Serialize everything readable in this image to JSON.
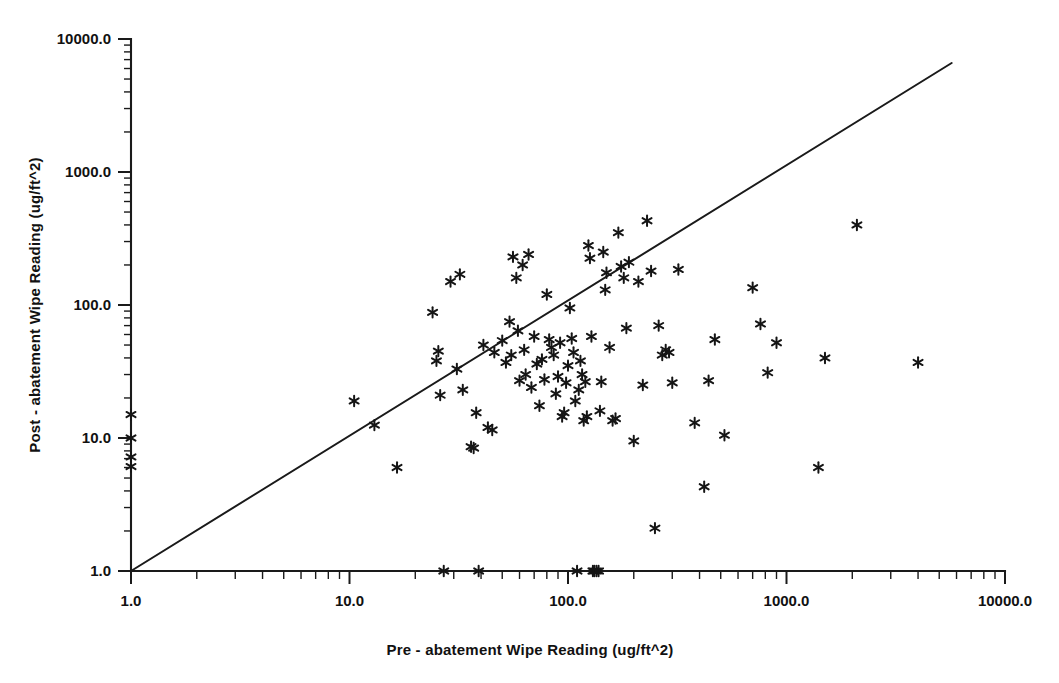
{
  "chart_data": {
    "type": "scatter",
    "title": "",
    "xlabel": "Pre - abatement Wipe Reading (ug/ft^2)",
    "ylabel": "Post - abatement Wipe Reading (ug/ft^2)",
    "xscale": "log",
    "yscale": "log",
    "xlim": [
      1.0,
      10000.0
    ],
    "ylim": [
      1.0,
      10000.0
    ],
    "grid": false,
    "legend": null,
    "xticklabels": [
      "1.0",
      "10.0",
      "100.0",
      "1000.0",
      "10000.0"
    ],
    "yticklabels": [
      "1.0",
      "10.0",
      "100.0",
      "1000.0",
      "10000.0"
    ],
    "xtickvalues": [
      1.0,
      10.0,
      100.0,
      1000.0,
      10000.0
    ],
    "ytickvalues": [
      1.0,
      10.0,
      100.0,
      1000.0,
      10000.0
    ],
    "marker": "asterisk",
    "marker_color": "#151515",
    "reference_line": {
      "label": "y = x identity line",
      "x": [
        1.0,
        5700.0
      ],
      "y": [
        1.0,
        6600.0
      ],
      "color": "#1a1a1a"
    },
    "n_points": 108,
    "points": [
      [
        1.0,
        15.0
      ],
      [
        1.0,
        10.0
      ],
      [
        1.0,
        7.2
      ],
      [
        1.0,
        6.1
      ],
      [
        10.5,
        19.0
      ],
      [
        13.0,
        12.5
      ],
      [
        16.5,
        6.0
      ],
      [
        24.0,
        88.0
      ],
      [
        25.0,
        38.0
      ],
      [
        25.5,
        45.0
      ],
      [
        26.0,
        21.0
      ],
      [
        27.0,
        1.0
      ],
      [
        29.0,
        150.0
      ],
      [
        31.0,
        33.0
      ],
      [
        32.0,
        170.0
      ],
      [
        33.0,
        23.0
      ],
      [
        36.0,
        8.6
      ],
      [
        37.0,
        8.4
      ],
      [
        38.0,
        15.5
      ],
      [
        39.0,
        1.0
      ],
      [
        41.0,
        50.0
      ],
      [
        43.0,
        12.0
      ],
      [
        45.0,
        11.5
      ],
      [
        46.0,
        44.0
      ],
      [
        50.0,
        54.0
      ],
      [
        52.0,
        37.0
      ],
      [
        54.0,
        75.0
      ],
      [
        55.0,
        42.0
      ],
      [
        56.0,
        230.0
      ],
      [
        58.0,
        160.0
      ],
      [
        59.0,
        64.0
      ],
      [
        60.0,
        27.0
      ],
      [
        62.0,
        200.0
      ],
      [
        63.0,
        46.0
      ],
      [
        64.0,
        30.0
      ],
      [
        66.0,
        240.0
      ],
      [
        68.0,
        24.0
      ],
      [
        70.0,
        58.0
      ],
      [
        72.0,
        36.0
      ],
      [
        74.0,
        17.5
      ],
      [
        76.0,
        39.0
      ],
      [
        78.0,
        27.5
      ],
      [
        80.0,
        120.0
      ],
      [
        82.0,
        55.0
      ],
      [
        84.0,
        48.0
      ],
      [
        86.0,
        42.0
      ],
      [
        88.0,
        21.5
      ],
      [
        90.0,
        29.0
      ],
      [
        92.0,
        52.0
      ],
      [
        94.0,
        14.5
      ],
      [
        96.0,
        15.5
      ],
      [
        98.0,
        26.0
      ],
      [
        100.0,
        35.0
      ],
      [
        102.0,
        95.0
      ],
      [
        104.0,
        56.0
      ],
      [
        106.0,
        44.0
      ],
      [
        108.0,
        19.0
      ],
      [
        110.0,
        1.0
      ],
      [
        112.0,
        23.0
      ],
      [
        114.0,
        38.0
      ],
      [
        116.0,
        30.0
      ],
      [
        118.0,
        13.5
      ],
      [
        120.0,
        26.5
      ],
      [
        122.0,
        14.5
      ],
      [
        124.0,
        280.0
      ],
      [
        126.0,
        225.0
      ],
      [
        128.0,
        58.0
      ],
      [
        130.0,
        1.0
      ],
      [
        132.0,
        1.0
      ],
      [
        135.0,
        1.0
      ],
      [
        138.0,
        1.0
      ],
      [
        140.0,
        16.0
      ],
      [
        142.0,
        26.5
      ],
      [
        145.0,
        250.0
      ],
      [
        148.0,
        130.0
      ],
      [
        150.0,
        175.0
      ],
      [
        155.0,
        48.0
      ],
      [
        160.0,
        13.5
      ],
      [
        165.0,
        14.0
      ],
      [
        170.0,
        350.0
      ],
      [
        175.0,
        195.0
      ],
      [
        180.0,
        160.0
      ],
      [
        185.0,
        67.0
      ],
      [
        190.0,
        210.0
      ],
      [
        200.0,
        9.5
      ],
      [
        210.0,
        150.0
      ],
      [
        220.0,
        25.0
      ],
      [
        230.0,
        430.0
      ],
      [
        240.0,
        180.0
      ],
      [
        250.0,
        2.1
      ],
      [
        260.0,
        70.0
      ],
      [
        270.0,
        42.0
      ],
      [
        280.0,
        46.0
      ],
      [
        290.0,
        44.0
      ],
      [
        300.0,
        26.0
      ],
      [
        320.0,
        185.0
      ],
      [
        380.0,
        13.0
      ],
      [
        420.0,
        4.3
      ],
      [
        440.0,
        27.0
      ],
      [
        470.0,
        55.0
      ],
      [
        520.0,
        10.5
      ],
      [
        700.0,
        135.0
      ],
      [
        760.0,
        72.0
      ],
      [
        820.0,
        31.0
      ],
      [
        900.0,
        52.0
      ],
      [
        1400.0,
        6.0
      ],
      [
        1500.0,
        40.0
      ],
      [
        2100.0,
        400.0
      ],
      [
        4000.0,
        37.0
      ]
    ]
  },
  "axes": {
    "x_title": "Pre - abatement Wipe Reading (ug/ft^2)",
    "y_title": "Post - abatement Wipe Reading (ug/ft^2)"
  }
}
